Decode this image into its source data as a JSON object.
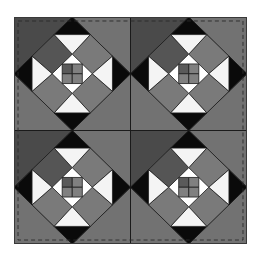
{
  "figure": {
    "grid": {
      "rows": 2,
      "cols": 2
    },
    "blocks": [
      {
        "row": 0,
        "col": 0
      },
      {
        "row": 0,
        "col": 1
      },
      {
        "row": 1,
        "col": 0
      },
      {
        "row": 1,
        "col": 1
      }
    ],
    "colors": {
      "background": "#ffffff",
      "dark_gray": "#4a4a4a",
      "medium_gray": "#727272",
      "square_dark": "#555555",
      "square_medium": "#7a7a7a",
      "center_dark": "#5a5a5a",
      "center_medium": "#808080",
      "black": "#0a0a0a",
      "white": "#f4f4f4",
      "seam": "#1a1a1a",
      "stitch": "#2a2a2a"
    },
    "stitching": "dashed border"
  }
}
